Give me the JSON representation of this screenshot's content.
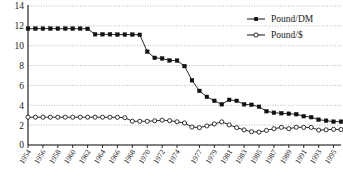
{
  "chart_data": {
    "type": "line",
    "title": "",
    "subtitle": "",
    "xlabel": "",
    "ylabel": "",
    "xlim": [
      1954,
      1996
    ],
    "ylim": [
      0,
      14
    ],
    "grid": true,
    "grid_style": "dotted-horizontal",
    "legend_position": "top-right",
    "yticks": [
      0,
      2,
      4,
      6,
      8,
      10,
      12,
      14
    ],
    "xticks": [
      1954,
      1956,
      1958,
      1960,
      1962,
      1964,
      1966,
      1968,
      1970,
      1972,
      1974,
      1977,
      1979,
      1981,
      1983,
      1985,
      1987,
      1989,
      1991,
      1993,
      1995
    ],
    "x": [
      1954,
      1955,
      1956,
      1957,
      1958,
      1959,
      1960,
      1961,
      1962,
      1963,
      1964,
      1965,
      1966,
      1967,
      1968,
      1969,
      1970,
      1971,
      1972,
      1973,
      1974,
      1975,
      1976,
      1977,
      1978,
      1979,
      1980,
      1981,
      1982,
      1983,
      1984,
      1985,
      1986,
      1987,
      1988,
      1989,
      1990,
      1991,
      1992,
      1993,
      1994,
      1995,
      1996
    ],
    "series": [
      {
        "name": "Pound/DM",
        "marker": "filled-square",
        "color": "#111111",
        "values": [
          11.72,
          11.72,
          11.72,
          11.72,
          11.72,
          11.72,
          11.72,
          11.72,
          11.7,
          11.15,
          11.15,
          11.15,
          11.12,
          11.12,
          11.12,
          11.1,
          9.4,
          8.78,
          8.72,
          8.52,
          8.5,
          7.95,
          6.52,
          5.45,
          4.85,
          4.45,
          4.1,
          4.55,
          4.45,
          4.1,
          4.05,
          3.85,
          3.4,
          3.25,
          3.2,
          3.15,
          3.1,
          2.9,
          2.8,
          2.55,
          2.45,
          2.35,
          2.35
        ]
      },
      {
        "name": "Pound/$",
        "marker": "open-circle",
        "color": "#111111",
        "values": [
          2.8,
          2.8,
          2.8,
          2.8,
          2.8,
          2.8,
          2.8,
          2.8,
          2.8,
          2.8,
          2.8,
          2.8,
          2.79,
          2.75,
          2.39,
          2.39,
          2.39,
          2.44,
          2.5,
          2.45,
          2.34,
          2.22,
          1.81,
          1.75,
          1.92,
          2.12,
          2.33,
          2.03,
          1.75,
          1.52,
          1.34,
          1.3,
          1.47,
          1.64,
          1.78,
          1.64,
          1.79,
          1.77,
          1.77,
          1.5,
          1.53,
          1.58,
          1.56
        ]
      }
    ]
  },
  "legend": {
    "entries": [
      {
        "label": "Pound/DM",
        "marker": "filled-square"
      },
      {
        "label": "Pound/$",
        "marker": "open-circle"
      }
    ]
  }
}
